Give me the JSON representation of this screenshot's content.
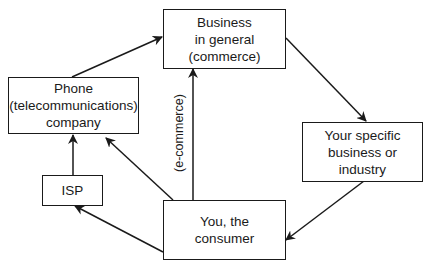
{
  "nodes": {
    "business": {
      "label": "Business\nin general\n(commerce)"
    },
    "phone": {
      "label": "Phone\n(telecommunications)\ncompany"
    },
    "isp": {
      "label": "ISP"
    },
    "specific": {
      "label": "Your specific\nbusiness or\nindustry"
    },
    "consumer": {
      "label": "You, the\nconsumer"
    }
  },
  "edges": [
    {
      "from": "phone",
      "to": "business"
    },
    {
      "from": "business",
      "to": "specific"
    },
    {
      "from": "specific",
      "to": "consumer"
    },
    {
      "from": "consumer",
      "to": "business",
      "label": "(e-commerce)"
    },
    {
      "from": "consumer",
      "to": "phone"
    },
    {
      "from": "consumer",
      "to": "isp"
    },
    {
      "from": "isp",
      "to": "phone"
    }
  ],
  "edge_label": "(e-commerce)",
  "colors": {
    "line": "#1a1a1a",
    "background": "#ffffff"
  }
}
